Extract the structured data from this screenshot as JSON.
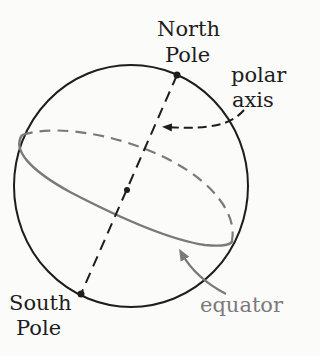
{
  "labels": {
    "north_pole_line1": "North",
    "north_pole_line2": "Pole",
    "south_pole_line1": "South",
    "south_pole_line2": "Pole",
    "polar_axis_line1": "polar",
    "polar_axis_line2": "axis",
    "equator": "equator"
  },
  "colors": {
    "ink": "#1d1d1d",
    "equator": "#7a7a7a",
    "background": "#fbfbfa"
  }
}
